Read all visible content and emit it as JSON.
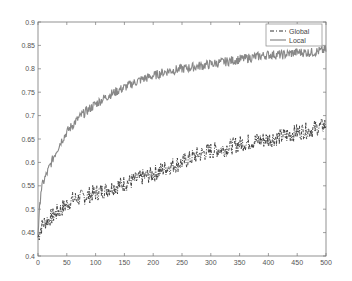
{
  "chart_data": {
    "type": "line",
    "title": "",
    "xlabel": "",
    "ylabel": "",
    "xlim": [
      0,
      500
    ],
    "ylim": [
      0.4,
      0.9
    ],
    "x_ticks": [
      0,
      50,
      100,
      150,
      200,
      250,
      300,
      350,
      400,
      450,
      500
    ],
    "y_ticks": [
      0.4,
      0.45,
      0.5,
      0.55,
      0.6,
      0.65,
      0.7,
      0.75,
      0.8,
      0.85,
      0.9
    ],
    "x_tick_labels": [
      "0",
      "50",
      "100",
      "150",
      "200",
      "250",
      "300",
      "350",
      "400",
      "450",
      "500"
    ],
    "y_tick_labels": [
      "0.4",
      "0.45",
      "0.5",
      "0.55",
      "0.6",
      "0.65",
      "0.7",
      "0.75",
      "0.8",
      "0.85",
      "0.9"
    ],
    "grid": false,
    "legend_position": "upper right",
    "x": [
      0,
      5,
      10,
      20,
      30,
      40,
      50,
      60,
      75,
      100,
      125,
      150,
      175,
      200,
      225,
      250,
      275,
      300,
      325,
      350,
      375,
      400,
      425,
      450,
      475,
      500
    ],
    "series": [
      {
        "name": "Global",
        "style": "dash-dot",
        "color": "#333333",
        "values": [
          0.44,
          0.46,
          0.47,
          0.48,
          0.49,
          0.5,
          0.51,
          0.52,
          0.525,
          0.535,
          0.545,
          0.555,
          0.565,
          0.575,
          0.59,
          0.6,
          0.615,
          0.625,
          0.63,
          0.64,
          0.645,
          0.65,
          0.655,
          0.665,
          0.67,
          0.68
        ]
      },
      {
        "name": "Local",
        "style": "solid",
        "color": "#888888",
        "values": [
          0.45,
          0.54,
          0.56,
          0.59,
          0.62,
          0.645,
          0.665,
          0.68,
          0.7,
          0.725,
          0.745,
          0.76,
          0.775,
          0.785,
          0.795,
          0.8,
          0.805,
          0.81,
          0.815,
          0.82,
          0.825,
          0.83,
          0.83,
          0.835,
          0.835,
          0.84
        ]
      }
    ]
  },
  "legend": {
    "items": [
      {
        "label": "Global"
      },
      {
        "label": "Local"
      }
    ]
  }
}
